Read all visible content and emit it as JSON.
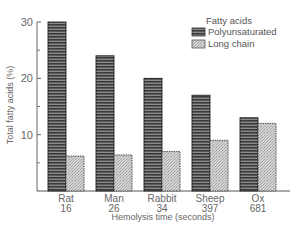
{
  "chart_data": {
    "type": "bar",
    "title": "",
    "xlabel": "Hemolysis time (seconds)",
    "ylabel": "Total fatty acids (%)",
    "categories": [
      "Rat",
      "Man",
      "Rabbit",
      "Sheep",
      "Ox"
    ],
    "category_sublabels": [
      "16",
      "26",
      "34",
      "397",
      "681"
    ],
    "series": [
      {
        "name": "Polyunsaturated",
        "values": [
          30,
          24,
          20,
          17,
          13
        ],
        "pattern": "horizontal-stripes",
        "color": "#4a4a4a"
      },
      {
        "name": "Long chain",
        "values": [
          6.2,
          6.4,
          7,
          9,
          12
        ],
        "pattern": "stipple",
        "color": "#bdbdbd"
      }
    ],
    "ylim": [
      0,
      30
    ],
    "yticks": [
      10,
      20,
      30
    ],
    "minor_yticks": [
      5,
      15,
      25
    ],
    "grid": false,
    "legend": {
      "title": "Fatty acids",
      "position": "upper-right"
    }
  }
}
